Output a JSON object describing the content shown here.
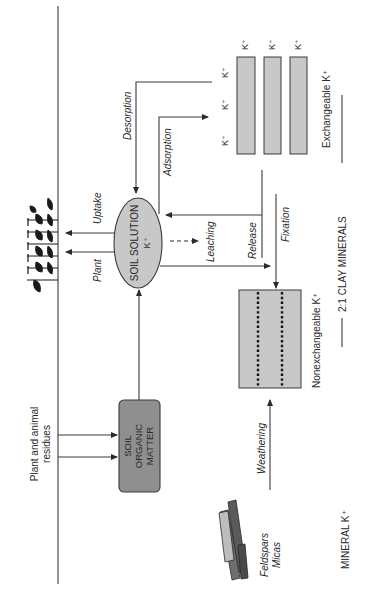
{
  "diagram": {
    "nodes": {
      "soil_solution": {
        "line1": "SOIL SOLUTION",
        "line2": "K⁺"
      },
      "soil_organic_matter": {
        "line1": "SOIL",
        "line2": "ORGANIC",
        "line3": "MATTER"
      },
      "exchangeable": {
        "label": "Exchangeable K⁺",
        "ion": "K⁺"
      },
      "nonexchangeable": {
        "label": "Nonexchangeable K⁺"
      },
      "minerals": {
        "line1": "Feldspars",
        "line2": "Micas"
      },
      "residues": {
        "line1": "Plant and animal",
        "line2": "residues"
      }
    },
    "processes": {
      "plant_uptake": "Plant",
      "uptake": "Uptake",
      "desorption": "Desorption",
      "adsorption": "Adsorption",
      "leaching": "Leaching",
      "release": "Release",
      "fixation": "Fixation",
      "weathering": "Weathering"
    },
    "sections": {
      "clay": "2:1 CLAY MINERALS",
      "mineral": "MINERAL K⁺"
    },
    "colors": {
      "box_fill": "#c8c8c8",
      "som_fill": "#8f8f8f",
      "line": "#3a3a3a"
    }
  }
}
